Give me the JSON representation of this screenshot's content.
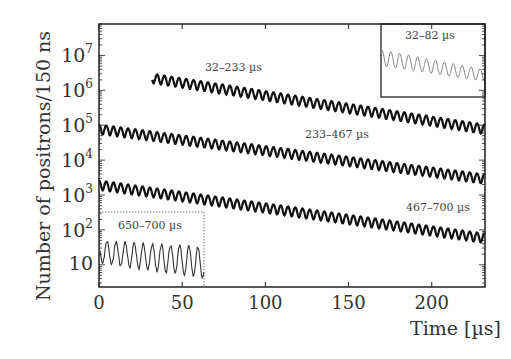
{
  "chart_data": {
    "type": "line",
    "title": "",
    "xlabel": "Time [µs]",
    "ylabel": "Number of positrons/150 ns",
    "yscale": "log",
    "xlim": [
      0,
      232
    ],
    "ylim": [
      2.3,
      80000000
    ],
    "grid": false,
    "x_ticks": [
      0,
      50,
      100,
      150,
      200
    ],
    "x_tick_labels": [
      "0",
      "50",
      "100",
      "150",
      "200"
    ],
    "y_ticks": [
      10,
      100,
      1000,
      10000,
      100000,
      1000000,
      10000000
    ],
    "y_tick_labels": [
      {
        "base": "10",
        "exp": ""
      },
      {
        "base": "10",
        "exp": "2"
      },
      {
        "base": "10",
        "exp": "3"
      },
      {
        "base": "10",
        "exp": "4"
      },
      {
        "base": "10",
        "exp": "5"
      },
      {
        "base": "10",
        "exp": "6"
      },
      {
        "base": "10",
        "exp": "7"
      }
    ],
    "oscillation_period_us": 4.37,
    "series": [
      {
        "name": "32–233 µs",
        "x_start": 32,
        "x_end": 232,
        "y_start": 2300000,
        "y_end": 80000,
        "rel_amplitude": 0.3
      },
      {
        "name": "233–467 µs",
        "x_start": 0,
        "x_end": 232,
        "y_start": 80000,
        "y_end": 3000,
        "rel_amplitude": 0.3
      },
      {
        "name": "467–700 µs",
        "x_start": 0,
        "x_end": 232,
        "y_start": 2000,
        "y_end": 60,
        "rel_amplitude": 0.3
      }
    ],
    "annotations": [
      {
        "text": "32–233 µs",
        "x_px": 205,
        "y_px": 61
      },
      {
        "text": "233–467 µs",
        "x_px": 305,
        "y_px": 128
      },
      {
        "text": "467–700 µs",
        "x_px": 406,
        "y_px": 201
      }
    ],
    "insets": [
      {
        "name": "32–82 µs",
        "position": "top-right",
        "border": "solid",
        "x_start": 32,
        "x_end": 82,
        "trend": "decreasing"
      },
      {
        "name": "650–700 µs",
        "position": "bottom-left",
        "border": "dotted",
        "x_start": 650,
        "x_end": 700,
        "y_start": 50,
        "y_end": 5,
        "trend": "decreasing"
      }
    ]
  }
}
